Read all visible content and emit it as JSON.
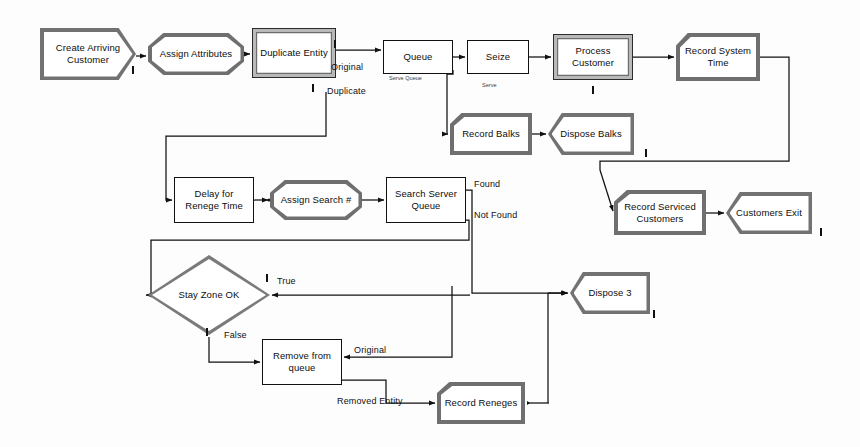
{
  "diagram": {
    "background_color": "#fdfdfd",
    "line_color": "#111111",
    "shadow_color": "#6f6f6f"
  },
  "nodes": [
    {
      "id": "create_arriving_customer",
      "label": "Create Arriving\nCustomer",
      "shape": "create",
      "x": 40,
      "y": 28,
      "w": 96,
      "h": 52
    },
    {
      "id": "assign_attributes",
      "label": "Assign Attributes",
      "shape": "octagon",
      "x": 148,
      "y": 33,
      "w": 96,
      "h": 42
    },
    {
      "id": "duplicate_entity",
      "label": "Duplicate Entity",
      "shape": "rect3d",
      "x": 252,
      "y": 28,
      "w": 84,
      "h": 50
    },
    {
      "id": "queue",
      "label": "Queue",
      "shape": "rect-plain",
      "x": 383,
      "y": 40,
      "w": 70,
      "h": 34
    },
    {
      "id": "seize",
      "label": "Seize",
      "shape": "rect-plain",
      "x": 467,
      "y": 40,
      "w": 62,
      "h": 34
    },
    {
      "id": "process_customer",
      "label": "Process\nCustomer",
      "shape": "rect3d",
      "x": 553,
      "y": 34,
      "w": 80,
      "h": 46
    },
    {
      "id": "record_system_time",
      "label": "Record System\nTime",
      "shape": "record",
      "x": 676,
      "y": 33,
      "w": 84,
      "h": 48
    },
    {
      "id": "record_balks",
      "label": "Record Balks",
      "shape": "record",
      "x": 450,
      "y": 113,
      "w": 82,
      "h": 42
    },
    {
      "id": "dispose_balks",
      "label": "Dispose Balks",
      "shape": "dispose",
      "x": 548,
      "y": 113,
      "w": 86,
      "h": 42
    },
    {
      "id": "record_serviced_customers",
      "label": "Record Serviced\nCustomers",
      "shape": "record",
      "x": 614,
      "y": 190,
      "w": 92,
      "h": 45
    },
    {
      "id": "customers_exit",
      "label": "Customers Exit",
      "shape": "dispose",
      "x": 726,
      "y": 192,
      "w": 86,
      "h": 42
    },
    {
      "id": "delay_for_renege_time",
      "label": "Delay for\nRenege Time",
      "shape": "rect-plain",
      "x": 174,
      "y": 177,
      "w": 80,
      "h": 46
    },
    {
      "id": "assign_search_number",
      "label": "Assign Search #",
      "shape": "octagon",
      "x": 270,
      "y": 180,
      "w": 92,
      "h": 40
    },
    {
      "id": "search_server_queue",
      "label": "Search Server\nQueue",
      "shape": "rect-plain",
      "x": 386,
      "y": 177,
      "w": 80,
      "h": 46
    },
    {
      "id": "stay_zone_ok",
      "label": "Stay Zone OK",
      "shape": "diamond",
      "x": 148,
      "y": 255,
      "w": 122,
      "h": 80
    },
    {
      "id": "dispose_3",
      "label": "Dispose 3",
      "shape": "dispose",
      "x": 570,
      "y": 272,
      "w": 80,
      "h": 42
    },
    {
      "id": "remove_from_queue",
      "label": "Remove from\nqueue",
      "shape": "rect-plain",
      "x": 262,
      "y": 339,
      "w": 80,
      "h": 46
    },
    {
      "id": "record_reneges",
      "label": "Record Reneges",
      "shape": "record",
      "x": 437,
      "y": 382,
      "w": 88,
      "h": 42
    }
  ],
  "edge_labels": [
    {
      "id": "lbl_original_dup",
      "text": "Original",
      "x": 331,
      "y": 62,
      "size": "normal"
    },
    {
      "id": "lbl_duplicate",
      "text": "Duplicate",
      "x": 327,
      "y": 86,
      "size": "normal"
    },
    {
      "id": "lbl_serve_queue",
      "text": "Serve Queue",
      "x": 389,
      "y": 75,
      "size": "tiny"
    },
    {
      "id": "lbl_serve",
      "text": "Serve",
      "x": 482,
      "y": 82,
      "size": "tiny"
    },
    {
      "id": "lbl_found",
      "text": "Found",
      "x": 474,
      "y": 179,
      "size": "normal"
    },
    {
      "id": "lbl_not_found",
      "text": "Not Found",
      "x": 474,
      "y": 210,
      "size": "normal"
    },
    {
      "id": "lbl_true",
      "text": "True",
      "x": 277,
      "y": 276,
      "size": "normal"
    },
    {
      "id": "lbl_false",
      "text": "False",
      "x": 224,
      "y": 330,
      "size": "normal"
    },
    {
      "id": "lbl_original_rem",
      "text": "Original",
      "x": 354,
      "y": 345,
      "size": "normal"
    },
    {
      "id": "lbl_removed_entity",
      "text": "Removed Entity",
      "x": 337,
      "y": 396,
      "size": "normal"
    }
  ],
  "port_ticks": [
    {
      "id": "tick_create_out",
      "x": 132,
      "y": 66
    },
    {
      "id": "tick_dup_orig",
      "x": 334,
      "y": 40
    },
    {
      "id": "tick_dup_dupl",
      "x": 312,
      "y": 84
    },
    {
      "id": "tick_process_out",
      "x": 592,
      "y": 86
    },
    {
      "id": "tick_dispose_balks",
      "x": 645,
      "y": 149
    },
    {
      "id": "tick_cust_exit",
      "x": 820,
      "y": 228
    },
    {
      "id": "tick_true",
      "x": 266,
      "y": 274
    },
    {
      "id": "tick_false",
      "x": 206,
      "y": 328
    },
    {
      "id": "tick_dispose3",
      "x": 653,
      "y": 310
    }
  ],
  "connections": [
    {
      "id": "c_create_assign",
      "from": "create_arriving_customer",
      "to": "assign_attributes"
    },
    {
      "id": "c_assign_dup",
      "from": "assign_attributes",
      "to": "duplicate_entity"
    },
    {
      "id": "c_dup_queue",
      "from": "duplicate_entity",
      "to": "queue",
      "label": "Original"
    },
    {
      "id": "c_dup_delay",
      "from": "duplicate_entity",
      "to": "delay_for_renege_time",
      "label": "Duplicate"
    },
    {
      "id": "c_queue_seize",
      "from": "queue",
      "to": "seize"
    },
    {
      "id": "c_queue_balks",
      "from": "queue",
      "to": "record_balks"
    },
    {
      "id": "c_seize_process",
      "from": "seize",
      "to": "process_customer"
    },
    {
      "id": "c_process_record",
      "from": "process_customer",
      "to": "record_system_time"
    },
    {
      "id": "c_record_serviced",
      "from": "record_system_time",
      "to": "record_serviced_customers"
    },
    {
      "id": "c_balks_dispose",
      "from": "record_balks",
      "to": "dispose_balks"
    },
    {
      "id": "c_serviced_exit",
      "from": "record_serviced_customers",
      "to": "customers_exit"
    },
    {
      "id": "c_delay_assignsearch",
      "from": "delay_for_renege_time",
      "to": "assign_search_number"
    },
    {
      "id": "c_assignsearch_search",
      "from": "assign_search_number",
      "to": "search_server_queue"
    },
    {
      "id": "c_search_dispose3",
      "from": "search_server_queue",
      "to": "dispose_3",
      "label": "Found"
    },
    {
      "id": "c_search_stayzone",
      "from": "search_server_queue",
      "to": "stay_zone_ok",
      "label": "Not Found"
    },
    {
      "id": "c_stayzone_dispose3",
      "from": "stay_zone_ok",
      "to": "dispose_3",
      "label": "True"
    },
    {
      "id": "c_stayzone_remove",
      "from": "stay_zone_ok",
      "to": "remove_from_queue",
      "label": "False"
    },
    {
      "id": "c_remove_dispose3",
      "from": "remove_from_queue",
      "to": "dispose_3",
      "label": "Original"
    },
    {
      "id": "c_remove_reneges",
      "from": "remove_from_queue",
      "to": "record_reneges",
      "label": "Removed Entity"
    },
    {
      "id": "c_reneges_dispose3",
      "from": "record_reneges",
      "to": "dispose_3"
    }
  ]
}
